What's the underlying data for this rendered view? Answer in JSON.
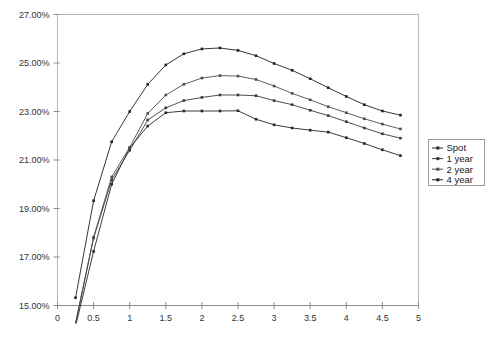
{
  "chart_data": {
    "type": "line",
    "title": "",
    "xlabel": "",
    "ylabel": "",
    "xlim": [
      0,
      5
    ],
    "ylim": [
      0.15,
      0.27
    ],
    "grid": false,
    "legend_position": "right",
    "x_ticks": [
      "0",
      "0.5",
      "1",
      "1.5",
      "2",
      "2.5",
      "3",
      "3.5",
      "4",
      "4.5",
      "5"
    ],
    "x_tick_values": [
      0,
      0.5,
      1,
      1.5,
      2,
      2.5,
      3,
      3.5,
      4,
      4.5,
      5
    ],
    "y_ticks": [
      "15.00%",
      "17.00%",
      "19.00%",
      "21.00%",
      "23.00%",
      "25.00%",
      "27.00%"
    ],
    "y_tick_values": [
      0.15,
      0.17,
      0.19,
      0.21,
      0.23,
      0.25,
      0.27
    ],
    "x": [
      0.25,
      0.5,
      0.75,
      1.0,
      1.25,
      1.5,
      1.75,
      2.0,
      2.25,
      2.5,
      2.75,
      3.0,
      3.25,
      3.5,
      3.75,
      4.0,
      4.25,
      4.5,
      4.75
    ],
    "series": [
      {
        "name": "Spot",
        "color": "#262626",
        "marker": "square",
        "values": [
          0.1415,
          0.1723,
          0.2,
          0.215,
          0.224,
          0.2295,
          0.2302,
          0.2302,
          0.2302,
          0.2303,
          0.2268,
          0.2245,
          0.2232,
          0.2223,
          0.2215,
          0.2192,
          0.2168,
          0.2142,
          0.2118
        ]
      },
      {
        "name": "1 year",
        "color": "#3a3a3a",
        "marker": "square",
        "values": [
          0.1425,
          0.1778,
          0.2017,
          0.214,
          0.2265,
          0.2315,
          0.2345,
          0.2358,
          0.2368,
          0.2368,
          0.2365,
          0.2345,
          0.2328,
          0.2305,
          0.2283,
          0.2258,
          0.2232,
          0.2208,
          0.219
        ]
      },
      {
        "name": "2 year",
        "color": "#4c4c4c",
        "marker": "square",
        "values": [
          0.1428,
          0.1782,
          0.203,
          0.2152,
          0.2292,
          0.2368,
          0.2412,
          0.2438,
          0.2448,
          0.2446,
          0.2432,
          0.2405,
          0.2375,
          0.2348,
          0.232,
          0.2295,
          0.227,
          0.2248,
          0.2228
        ]
      },
      {
        "name": "4 year",
        "color": "#1f1f1f",
        "marker": "square",
        "values": [
          0.1532,
          0.1932,
          0.2175,
          0.23,
          0.2412,
          0.2492,
          0.2538,
          0.2558,
          0.2562,
          0.2552,
          0.253,
          0.2498,
          0.247,
          0.2435,
          0.2398,
          0.2362,
          0.2328,
          0.2302,
          0.2285
        ]
      }
    ]
  },
  "legend": {
    "items": [
      {
        "label": "Spot"
      },
      {
        "label": "1 year"
      },
      {
        "label": "2 year"
      },
      {
        "label": "4 year"
      }
    ]
  }
}
